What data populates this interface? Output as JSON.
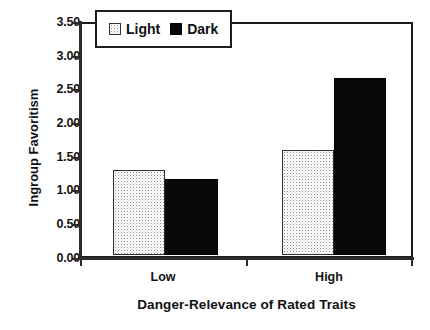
{
  "chart_data": {
    "type": "bar",
    "title": "",
    "xlabel": "Danger-Relevance of Rated Traits",
    "ylabel": "Ingroup Favoritism",
    "categories": [
      "Low",
      "High"
    ],
    "series": [
      {
        "name": "Light",
        "values": [
          1.3,
          1.6
        ],
        "swatch": "light-stipple-swatch"
      },
      {
        "name": "Dark",
        "values": [
          1.15,
          2.7
        ],
        "swatch": "dark-solid-swatch"
      }
    ],
    "ylim": [
      0.0,
      3.5
    ],
    "ytick_values": [
      3.5,
      3.0,
      2.5,
      2.0,
      1.5,
      1.0,
      0.5,
      0.0
    ],
    "ytick_labels": [
      "3.50",
      "3.00",
      "2.50",
      "2.00",
      "1.50",
      "1.00",
      "0.50",
      "0.00"
    ],
    "grid": false,
    "legend_position": "top-left-inside",
    "colors": {
      "light_fill": "#ffffff",
      "light_pattern": "#8d8d8d",
      "dark_fill": "#080808",
      "axis": "#2b2b2b",
      "text": "#111111"
    }
  },
  "legend": {
    "entries": [
      {
        "label": "Light",
        "swatch": "light"
      },
      {
        "label": "Dark",
        "swatch": "dark"
      }
    ]
  }
}
